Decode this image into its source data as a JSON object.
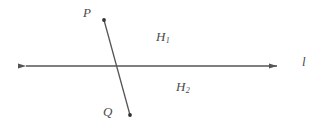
{
  "figure": {
    "type": "geometry-diagram",
    "background_color": "#ffffff",
    "stroke_color": "#555555",
    "text_color": "#4a4a4a"
  },
  "labels": {
    "point_p": "P",
    "point_q": "Q",
    "halfplane_1_base": "H",
    "halfplane_1_sub": "1",
    "halfplane_2_base": "H",
    "halfplane_2_sub": "2",
    "line_l": "l"
  },
  "geometry": {
    "line_l": {
      "x1": 17,
      "y1": 66,
      "x2": 286,
      "y2": 66,
      "arrow_left": true,
      "arrow_right": true
    },
    "segment_pq": {
      "x1": 104,
      "y1": 20,
      "x2": 130,
      "y2": 115,
      "endpoint_dots": true
    },
    "intersection": {
      "x": 117,
      "y": 66
    }
  }
}
